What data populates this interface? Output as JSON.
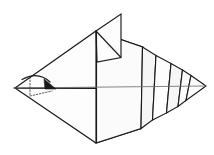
{
  "figure": {
    "title": "Origami fold step diagram",
    "canvas": {
      "width": 214,
      "height": 155,
      "background": "#ffffff"
    },
    "colors": {
      "paper_fill": "#fdfdfd",
      "paper_fill_shaded": "#f6f6f6",
      "edge_stroke": "#1a1a1a",
      "crease_stroke": "#6e6e6e",
      "guide_stroke": "#4a4a4a",
      "arrow_color": "#1a1a1a"
    },
    "line_styles": {
      "edge": "solid",
      "crease": "thin-solid",
      "guide": "dotted",
      "arrow": "curved-solid-with-solid-head"
    }
  },
  "geometry": {
    "left_point": {
      "x": 15,
      "y": 88
    },
    "right_tip": {
      "x": 206,
      "y": 86
    },
    "body_top_apex": {
      "x": 96,
      "y": 31
    },
    "body_bottom_apex": {
      "x": 96,
      "y": 143
    },
    "center_axis": {
      "x1": 15,
      "y1": 88,
      "x2": 206,
      "y2": 86
    },
    "fin_top_right": {
      "x": 121,
      "y": 14
    },
    "pleat_count": 4
  },
  "shapes": {
    "body_upper_left": "15,88 96,31 142,47 96,88",
    "body_lower_left": "15,88 96,143 140,128 96,88",
    "vertical_fin": "96,31 121,14 121,57 96,62",
    "pleat_1": "142,47 155,55 152,120 140,128",
    "pleat_2": "155,55 170,63 166,113 152,120",
    "pleat_3": "170,63 182,70 178,106 166,113",
    "pleat_4": "182,70 190,75 186,100 178,106",
    "tail_tip": "190,75 206,86 186,100"
  },
  "annotation": {
    "arrow": {
      "name": "valley-fold-arrow",
      "description": "curved arrow indicating fold of the left point toward the right",
      "start": {
        "x": 22,
        "y": 80
      },
      "end": {
        "x": 54,
        "y": 88
      },
      "head_direction": "right-down"
    },
    "guides": [
      {
        "name": "fold-guide-vertical",
        "from": {
          "x": 30,
          "y": 77
        },
        "to": {
          "x": 30,
          "y": 96
        }
      },
      {
        "name": "fold-guide-lower",
        "from": {
          "x": 30,
          "y": 96
        },
        "to": {
          "x": 52,
          "y": 91
        }
      }
    ]
  }
}
